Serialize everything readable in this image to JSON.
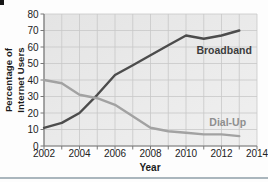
{
  "chart_data": {
    "type": "line",
    "title": "",
    "xlabel": "Year",
    "ylabel": "Percentage of Internet Users",
    "ylabel_lines": [
      "Percentage of",
      "Internet Users"
    ],
    "x": [
      2002,
      2003,
      2004,
      2005,
      2006,
      2007,
      2008,
      2009,
      2010,
      2011,
      2012,
      2013
    ],
    "series": [
      {
        "name": "Broadband",
        "values": [
          11,
          14,
          20,
          31,
          43,
          49,
          55,
          61,
          67,
          65,
          67,
          70
        ],
        "color": "#4c4c4c",
        "label_color": "#3d3d3d",
        "label_at": {
          "x": 2012.15,
          "y": 56
        }
      },
      {
        "name": "Dial-Up",
        "values": [
          40,
          38,
          31,
          29,
          25,
          18,
          11,
          9,
          8,
          7,
          7,
          6
        ],
        "color": "#a2a2a2",
        "label_color": "#8f8f8f",
        "label_at": {
          "x": 2012.35,
          "y": 12
        }
      }
    ],
    "xlim": [
      2002,
      2014
    ],
    "ylim": [
      0,
      80
    ],
    "xticks": [
      2002,
      2004,
      2006,
      2008,
      2010,
      2012,
      2014
    ],
    "yticks": [
      0,
      10,
      20,
      30,
      40,
      50,
      60,
      70,
      80
    ],
    "x_grid_step": 1,
    "grid": true,
    "legend_position": "inline-labels",
    "colors": {
      "plot_bg_start": "#e4e4e4",
      "plot_bg_end": "#f0f0f0",
      "grid": "#c8c8c8",
      "axis": "#787878",
      "tick_text": "#222222"
    }
  }
}
